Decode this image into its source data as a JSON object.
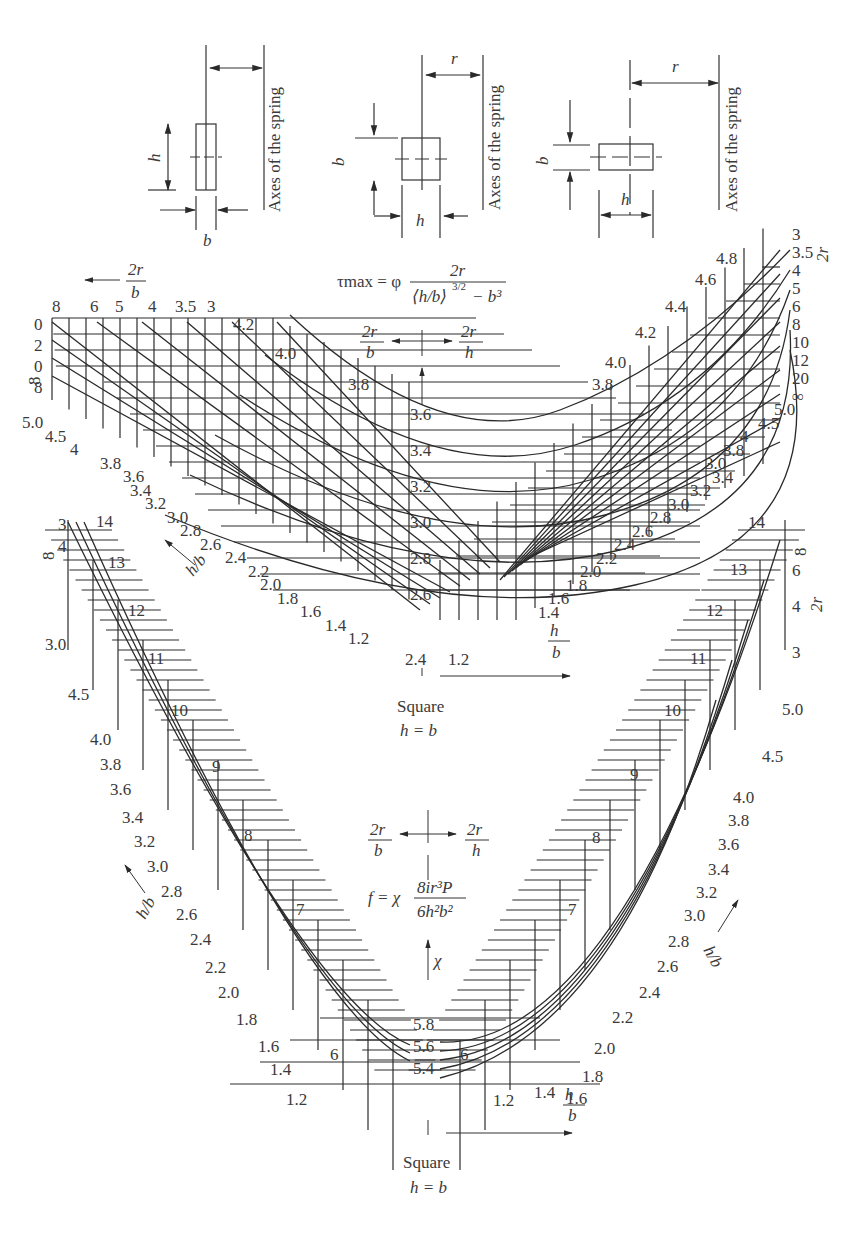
{
  "cross_sections": [
    {
      "id": "tall",
      "orientation": "h > b",
      "dim_labels": {
        "vertical": "h",
        "horizontal": "b"
      },
      "axis_label": "Axes of the spring"
    },
    {
      "id": "square",
      "orientation": "h = b",
      "dim_labels": {
        "vertical": "b",
        "horizontal": "h",
        "radius": "r"
      },
      "axis_label": "Axes of the spring"
    },
    {
      "id": "wide",
      "orientation": "h < b",
      "dim_labels": {
        "vertical": "b",
        "horizontal": "h",
        "radius": "r"
      },
      "axis_label": "Axes of the spring"
    }
  ],
  "upper_chart": {
    "formula": {
      "lhs": "τmax = φ",
      "numerator": "2r",
      "denominator": "⟨h/b⟩^3/2 − b^3"
    },
    "direction_left": {
      "num": "2r",
      "den": "b"
    },
    "direction_right": {
      "num": "2r",
      "den": "h"
    },
    "top_left_arrow_label": {
      "num": "2r",
      "den": "b"
    },
    "top_left_2r_b_ticks": [
      "8",
      "6",
      "5",
      "4",
      "3.5",
      "3"
    ],
    "left_edge_ticks": [
      "0",
      "2",
      "0",
      "8"
    ],
    "left_hb_ticks": [
      "5.0",
      "4.5",
      "4",
      "3.8",
      "3.6",
      "3.4",
      "3.2",
      "3.0",
      "2.8",
      "2.6",
      "2.4",
      "2.2",
      "2.0",
      "1.8",
      "1.6",
      "1.4",
      "1.2"
    ],
    "left_phi_ticks": [
      "4.2",
      "4.0",
      "3.8"
    ],
    "center_phi_ticks": [
      "3.6",
      "3.4",
      "3.2",
      "3.0",
      "2.8",
      "2.6"
    ],
    "bottom_center_tick": "2.4",
    "bottom_right_tick": "1.2",
    "right_phi_ticks": [
      "4.8",
      "4.6",
      "4.4",
      "4.2",
      "4.0",
      "3.8"
    ],
    "right_2r_h_ticks": [
      "3",
      "3.5",
      "4",
      "5",
      "6",
      "8",
      "10",
      "12",
      "20",
      "∞"
    ],
    "right_axis_title": "2r",
    "right_hb_ticks": [
      "5.0",
      "4.5",
      "4",
      "3.8",
      "3.0",
      "3.4",
      "3.2",
      "3.0",
      "2.8",
      "2.6",
      "2.4",
      "2.2",
      "2.0",
      "1.8",
      "1.6",
      "1.4"
    ],
    "hb_axis_label": {
      "num": "h",
      "den": "b"
    },
    "square_caption": "Square",
    "square_eq": "h = b"
  },
  "lower_chart": {
    "formula": {
      "lhs": "f = χ",
      "numerator": "8ir³P",
      "denominator": "6h²b²"
    },
    "chi_label": "χ",
    "direction_left": {
      "num": "2r",
      "den": "b"
    },
    "direction_right": {
      "num": "2r",
      "den": "h"
    },
    "left_2r_b_ticks": [
      "3",
      "4",
      "∞"
    ],
    "left_chi_ticks": [
      "14",
      "13",
      "12",
      "11",
      "10",
      "9",
      "8",
      "7",
      "6"
    ],
    "left_hb_ticks": [
      "3.0",
      "4.5",
      "4.0",
      "3.8",
      "3.6",
      "3.4",
      "3.2",
      "3.0",
      "2.8",
      "2.6",
      "2.4",
      "2.2",
      "2.0",
      "1.8",
      "1.6",
      "1.4",
      "1.2"
    ],
    "center_chi_ticks": [
      "5.8",
      "5.6",
      "5.4"
    ],
    "right_chi_ticks": [
      "14",
      "13",
      "12",
      "11",
      "10",
      "9",
      "8",
      "7",
      "6"
    ],
    "right_2r_h_ticks": [
      "∞",
      "6",
      "4",
      "3"
    ],
    "right_axis_title": "2r",
    "right_hb_ticks": [
      "5.0",
      "4.5",
      "4.0",
      "3.8",
      "3.6",
      "3.4",
      "3.2",
      "3.0",
      "2.8",
      "2.6",
      "2.4",
      "2.2",
      "2.0",
      "1.8",
      "1.6",
      "1.4",
      "1.2"
    ],
    "hb_axis_label": {
      "num": "h",
      "den": "b"
    },
    "square_caption": "Square",
    "square_eq": "h = b"
  }
}
